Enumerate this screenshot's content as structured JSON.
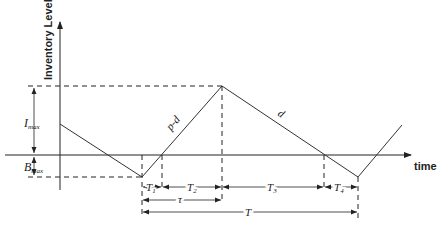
{
  "diagram": {
    "y_axis_label": "Inventory Level",
    "x_axis_label": "time",
    "levels": {
      "imax": {
        "main": "I",
        "sub": "max"
      },
      "bmax": {
        "main": "B",
        "sub": "max"
      }
    },
    "slopes": {
      "rising": "p-d",
      "falling": "d"
    },
    "intervals": {
      "t1": {
        "main": "T",
        "sub": "1"
      },
      "t2": {
        "main": "T",
        "sub": "2"
      },
      "t3": {
        "main": "T",
        "sub": "3"
      },
      "t4": {
        "main": "T",
        "sub": "4"
      },
      "tau": "τ",
      "cycle": "T"
    }
  }
}
